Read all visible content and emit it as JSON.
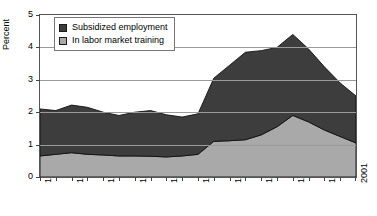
{
  "chart_data": {
    "type": "area",
    "stacked": true,
    "title": "",
    "xlabel": "",
    "ylabel": "Percent",
    "ylim": [
      0,
      5
    ],
    "xlim": [
      1981,
      2001
    ],
    "yticks": [
      "0",
      "1",
      "2",
      "3",
      "4",
      "5"
    ],
    "grid": true,
    "legend_position": "top-left",
    "x": [
      1981,
      1982,
      1983,
      1984,
      1985,
      1986,
      1987,
      1988,
      1989,
      1990,
      1991,
      1992,
      1993,
      1994,
      1995,
      1996,
      1997,
      1998,
      1999,
      2000,
      2001
    ],
    "xtick_labels": [
      "1981",
      "1983",
      "1985",
      "1987",
      "1989",
      "1991",
      "1993",
      "1995",
      "1997",
      "1999",
      "2001"
    ],
    "series": [
      {
        "name": "In labor market training",
        "color": "#a9a9a9",
        "values": [
          0.65,
          0.7,
          0.75,
          0.7,
          0.68,
          0.65,
          0.65,
          0.64,
          0.62,
          0.65,
          0.7,
          1.1,
          1.12,
          1.15,
          1.3,
          1.55,
          1.9,
          1.7,
          1.45,
          1.25,
          1.05
        ]
      },
      {
        "name": "Subsidized employment",
        "color": "#3d3d3d",
        "values": [
          1.45,
          1.35,
          1.47,
          1.45,
          1.32,
          1.25,
          1.35,
          1.41,
          1.3,
          1.2,
          1.25,
          1.95,
          2.33,
          2.7,
          2.6,
          2.45,
          2.5,
          2.25,
          1.95,
          1.65,
          1.45
        ]
      }
    ],
    "totals": [
      2.1,
      2.05,
      2.22,
      2.15,
      2.0,
      1.9,
      2.0,
      2.05,
      1.92,
      1.85,
      1.95,
      3.05,
      3.45,
      3.85,
      3.9,
      4.0,
      4.4,
      3.95,
      3.4,
      2.9,
      2.5
    ]
  }
}
